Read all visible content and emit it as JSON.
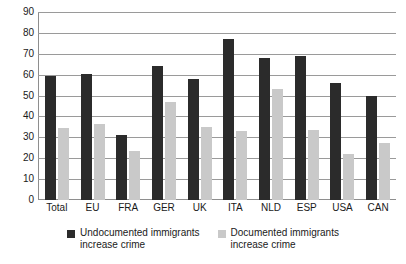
{
  "chart_data": {
    "type": "bar",
    "title": "",
    "xlabel": "",
    "ylabel": "",
    "ylim": [
      0,
      90
    ],
    "ytick_step": 10,
    "yticks": [
      0,
      10,
      20,
      30,
      40,
      50,
      60,
      70,
      80,
      90
    ],
    "grid": true,
    "legend_position": "bottom",
    "categories": [
      "Total",
      "EU",
      "FRA",
      "GER",
      "UK",
      "ITA",
      "NLD",
      "ESP",
      "USA",
      "CAN"
    ],
    "series": [
      {
        "name": "Undocumented immigrants increase crime",
        "color": "#2b2b2b",
        "values": [
          59.5,
          60.5,
          31,
          64,
          58,
          77,
          68,
          69,
          56,
          50
        ]
      },
      {
        "name": "Documented immigrants increase crime",
        "color": "#c9c9c9",
        "values": [
          34.5,
          36.5,
          23.5,
          47,
          35,
          33,
          53,
          33.5,
          22,
          27.5
        ]
      }
    ]
  },
  "legend": {
    "entries": [
      {
        "line1": "Undocumented immigrants",
        "line2": "increase crime",
        "swatch": "dark"
      },
      {
        "line1": "Documented immigrants",
        "line2": "increase crime",
        "swatch": "light"
      }
    ]
  },
  "colors": {
    "dark_series": "#2b2b2b",
    "light_series": "#c9c9c9",
    "gridline": "#9a9a9a",
    "axis": "#8e8e8e",
    "text": "#1a1a1a",
    "background": "#ffffff"
  }
}
